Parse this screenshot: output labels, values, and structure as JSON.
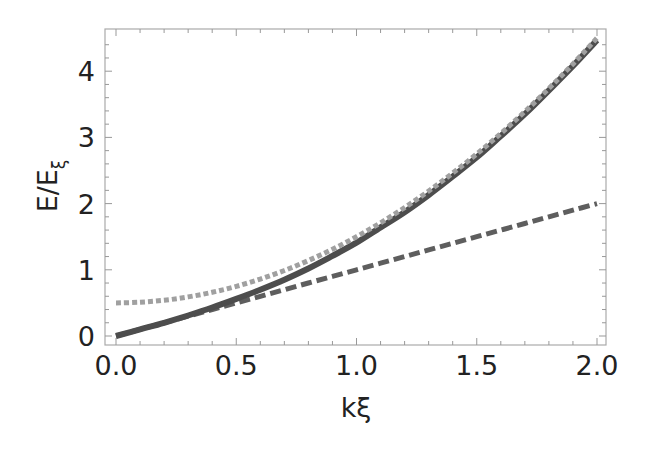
{
  "chart_data": {
    "type": "line",
    "title": "",
    "xlabel": "kξ",
    "ylabel": "E/E_ξ",
    "ylabel_main": "E/E",
    "ylabel_sub": "ξ",
    "xlim": [
      -0.05,
      2.04
    ],
    "ylim": [
      -0.14,
      4.62
    ],
    "xticks": [
      0.0,
      0.5,
      1.0,
      1.5,
      2.0
    ],
    "xtick_labels": [
      "0.0",
      "0.5",
      "1.0",
      "1.5",
      "2.0"
    ],
    "yticks": [
      0,
      1,
      2,
      3,
      4
    ],
    "ytick_labels": [
      "0",
      "1",
      "2",
      "3",
      "4"
    ],
    "grid": false,
    "legend": null,
    "x": [
      0.0,
      0.1,
      0.2,
      0.3,
      0.4,
      0.5,
      0.6,
      0.7,
      0.8,
      0.9,
      1.0,
      1.1,
      1.2,
      1.3,
      1.4,
      1.5,
      1.6,
      1.7,
      1.8,
      1.9,
      2.0
    ],
    "series": [
      {
        "name": "Bogoliubov dispersion (solid)",
        "style": "solid",
        "color": "#555555",
        "values": [
          0.0,
          0.1,
          0.2,
          0.31,
          0.43,
          0.56,
          0.7,
          0.85,
          1.02,
          1.21,
          1.41,
          1.64,
          1.87,
          2.13,
          2.41,
          2.7,
          3.02,
          3.35,
          3.71,
          4.08,
          4.47
        ]
      },
      {
        "name": "Free-particle shifted k²+1/2 (dotted)",
        "style": "dotted",
        "color": "#999999",
        "values": [
          0.5,
          0.51,
          0.54,
          0.59,
          0.66,
          0.75,
          0.86,
          0.99,
          1.14,
          1.31,
          1.5,
          1.71,
          1.94,
          2.19,
          2.46,
          2.75,
          3.06,
          3.39,
          3.74,
          4.11,
          4.5
        ]
      },
      {
        "name": "Phonon linear (dashed)",
        "style": "dashed",
        "color": "#666666",
        "values": [
          0.0,
          0.1,
          0.2,
          0.3,
          0.4,
          0.5,
          0.6,
          0.7,
          0.8,
          0.9,
          1.0,
          1.1,
          1.2,
          1.3,
          1.4,
          1.5,
          1.6,
          1.7,
          1.8,
          1.9,
          2.0
        ]
      }
    ]
  }
}
